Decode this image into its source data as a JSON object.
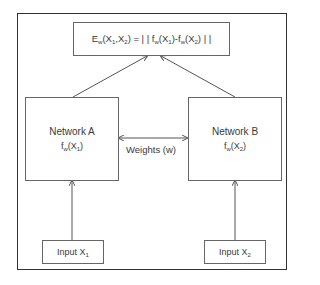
{
  "diagram": {
    "type": "siamese-network",
    "loss_box": {
      "formula": {
        "parts": [
          "E",
          "w",
          "(X",
          "1",
          ",X",
          "2",
          ") = | | f",
          "w",
          "(X",
          "1",
          ")-f",
          "w",
          "(X",
          "2",
          ") | |"
        ]
      },
      "text": "Ew(X1,X2) = ||fw(X1)-fw(X2)||"
    },
    "network_a": {
      "title": "Network A",
      "func": [
        "f",
        "w",
        "(X",
        "1",
        ")"
      ]
    },
    "network_b": {
      "title": "Network B",
      "func": [
        "f",
        "w",
        "(X",
        "2",
        ")"
      ]
    },
    "shared": {
      "label": "Weights (w)"
    },
    "input_1": {
      "label": [
        "Input X",
        "1"
      ]
    },
    "input_2": {
      "label": [
        "Input X",
        "2"
      ]
    },
    "colors": {
      "line": "#555555",
      "frame": "#333333",
      "text": "#3a3a3a"
    }
  }
}
